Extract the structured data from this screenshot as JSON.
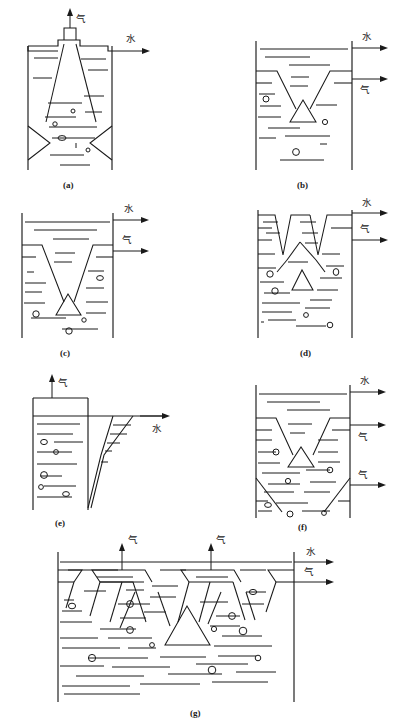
{
  "figure": {
    "kind": "technical-line-drawing",
    "labels": {
      "gas": "气",
      "water": "水"
    },
    "stroke_color": "#1a1a1a",
    "background_color": "#ffffff",
    "panels": [
      {
        "id": "a",
        "caption": "(a)",
        "outlets": [
          {
            "label": "气",
            "direction": "up",
            "position": "top-center"
          },
          {
            "label": "水",
            "direction": "right",
            "position": "top-right"
          }
        ],
        "internals": [
          "central-chimney",
          "flared-cone-skirt",
          "left-wall-triangle-baffle",
          "right-wall-triangle-baffle"
        ]
      },
      {
        "id": "b",
        "caption": "(b)",
        "outlets": [
          {
            "label": "水",
            "direction": "right",
            "position": "top-right"
          },
          {
            "label": "气",
            "direction": "right",
            "position": "upper-right"
          }
        ],
        "internals": [
          "v-funnel",
          "center-triangle-deflector"
        ]
      },
      {
        "id": "c",
        "caption": "(c)",
        "outlets": [
          {
            "label": "水",
            "direction": "right",
            "position": "top-right"
          },
          {
            "label": "气",
            "direction": "right",
            "position": "upper-right"
          }
        ],
        "internals": [
          "deep-v-funnel",
          "center-triangle-deflector"
        ]
      },
      {
        "id": "d",
        "caption": "(d)",
        "outlets": [
          {
            "label": "水",
            "direction": "right",
            "position": "top-right"
          },
          {
            "label": "气",
            "direction": "right",
            "position": "upper-right"
          }
        ],
        "internals": [
          "twin-v-funnels",
          "wide-inverted-v-baffle",
          "center-triangle-deflector"
        ]
      },
      {
        "id": "e",
        "caption": "(e)",
        "outlets": [
          {
            "label": "气",
            "direction": "up",
            "position": "top-center"
          },
          {
            "label": "水",
            "direction": "right",
            "position": "mid-right-launder"
          }
        ],
        "internals": [
          "freeboard-box",
          "inclined-overflow-launder"
        ]
      },
      {
        "id": "f",
        "caption": "(f)",
        "outlets": [
          {
            "label": "水",
            "direction": "right",
            "position": "top-right"
          },
          {
            "label": "气",
            "direction": "right",
            "position": "upper-right"
          },
          {
            "label": "气",
            "direction": "right",
            "position": "lower-right"
          }
        ],
        "internals": [
          "upper-v-funnel",
          "center-triangle-deflector",
          "lower-v-funnel"
        ]
      },
      {
        "id": "g",
        "caption": "(g)",
        "outlets": [
          {
            "label": "气",
            "direction": "up",
            "position": "top-left-stack"
          },
          {
            "label": "气",
            "direction": "up",
            "position": "top-right-stack"
          },
          {
            "label": "水",
            "direction": "right",
            "position": "top-right"
          },
          {
            "label": "气",
            "direction": "right",
            "position": "upper-right"
          }
        ],
        "internals": [
          "two-trapezoid-gas-hoods",
          "side-half-hoods",
          "diagonal-baffles",
          "center-triangle-deflector"
        ]
      }
    ]
  }
}
